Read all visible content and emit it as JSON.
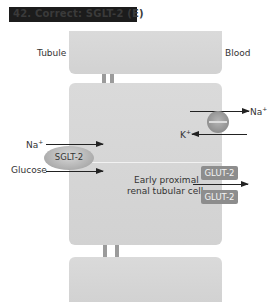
{
  "header": {
    "title": "42.  Correct: SGLT-2 (E)"
  },
  "labels": {
    "tubule": "Tubule",
    "blood": "Blood",
    "na_left": "Na",
    "na_left_sup": "+",
    "glucose": "Glucose",
    "na_right": "Na",
    "na_right_sup": "+",
    "k": "K",
    "k_sup": "+",
    "cell_line1": "Early proximal",
    "cell_line2": "renal tubular cell"
  },
  "transporters": {
    "sglt": "SGLT-2",
    "glut_top": "GLUT-2",
    "glut_bottom": "GLUT-2"
  },
  "colors": {
    "header_bg": "#1c1c1c",
    "cell_fill": "#d6d6d6",
    "glut_fill": "#8d8d8d",
    "arrow": "#222222"
  }
}
